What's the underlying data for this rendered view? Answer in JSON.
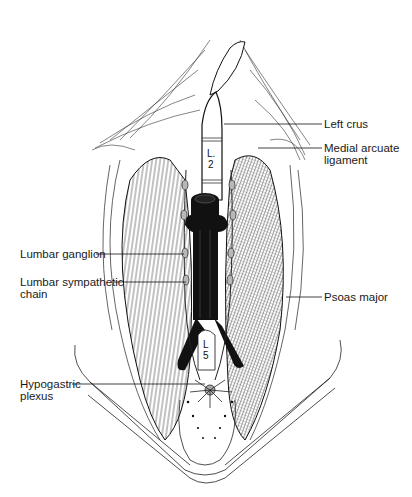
{
  "figure": {
    "vertebra_labels": [
      {
        "id": "l2",
        "text": "L.\n2"
      },
      {
        "id": "l5",
        "text": "L\n5"
      }
    ],
    "labels": [
      {
        "id": "left-crus",
        "text": "Left crus",
        "side": "right"
      },
      {
        "id": "medial-arcuate-ligament",
        "text": "Medial arcuate\nligament",
        "side": "right"
      },
      {
        "id": "lumbar-ganglion",
        "text": "Lumbar ganglion",
        "side": "left"
      },
      {
        "id": "lumbar-sympathetic-chain",
        "text": "Lumbar sympathetic\nchain",
        "side": "left"
      },
      {
        "id": "psoas-major",
        "text": "Psoas major",
        "side": "right"
      },
      {
        "id": "hypogastric-plexus",
        "text": "Hypogastric\nplexus",
        "side": "left"
      }
    ],
    "colors": {
      "ink": "#111111",
      "background": "#ffffff",
      "hatch": "#555555",
      "vessel": "#0d0d0d",
      "ganglion": "#b8b8b8"
    }
  }
}
